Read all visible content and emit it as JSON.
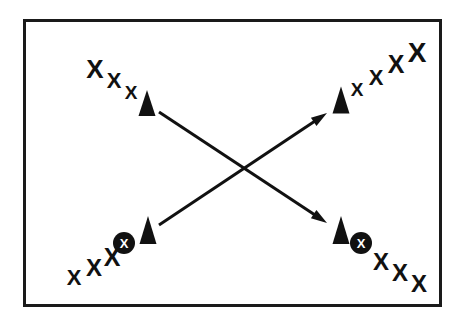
{
  "figure": {
    "background_color": "#ffffff",
    "ink_color": "#111111",
    "frame": {
      "name": "diagram-border",
      "x": 23,
      "y": 19,
      "width": 419,
      "height": 288,
      "stroke_width": 3,
      "color": "#1a1a1a"
    },
    "x_mark_glyph": "X",
    "circled_x_glyph": "X",
    "clusters": [
      {
        "id": "top-left",
        "label": "top-left-cluster",
        "x_marks": [
          {
            "cx": 95,
            "cy": 69,
            "size": 26
          },
          {
            "cx": 114,
            "cy": 80,
            "size": 22
          },
          {
            "cx": 131,
            "cy": 92,
            "size": 19
          }
        ],
        "cones": [
          {
            "cx": 147,
            "cy": 103,
            "width": 17,
            "height": 26
          }
        ],
        "circled_x": []
      },
      {
        "id": "top-right",
        "label": "top-right-cluster",
        "x_marks": [
          {
            "cx": 357,
            "cy": 89,
            "size": 19
          },
          {
            "cx": 376,
            "cy": 77,
            "size": 22
          },
          {
            "cx": 396,
            "cy": 64,
            "size": 25
          },
          {
            "cx": 417,
            "cy": 52,
            "size": 28
          }
        ],
        "cones": [
          {
            "cx": 341,
            "cy": 100,
            "width": 17,
            "height": 27
          }
        ],
        "circled_x": []
      },
      {
        "id": "bottom-left",
        "label": "bottom-left-cluster",
        "x_marks": [
          {
            "cx": 74,
            "cy": 277,
            "size": 22
          },
          {
            "cx": 94,
            "cy": 267,
            "size": 24
          },
          {
            "cx": 112,
            "cy": 257,
            "size": 25
          }
        ],
        "cones": [
          {
            "cx": 148,
            "cy": 230,
            "width": 17,
            "height": 28
          }
        ],
        "circled_x": [
          {
            "cx": 124,
            "cy": 243,
            "r": 11
          }
        ]
      },
      {
        "id": "bottom-right",
        "label": "bottom-right-cluster",
        "x_marks": [
          {
            "cx": 381,
            "cy": 261,
            "size": 24
          },
          {
            "cx": 400,
            "cy": 272,
            "size": 24
          },
          {
            "cx": 419,
            "cy": 283,
            "size": 24
          }
        ],
        "cones": [
          {
            "cx": 341,
            "cy": 230,
            "width": 17,
            "height": 28
          }
        ],
        "circled_x": [
          {
            "cx": 361,
            "cy": 243,
            "r": 11
          }
        ]
      }
    ],
    "arrows": [
      {
        "id": "arrow-down-right",
        "label": "arrow-top-left-to-bottom-right",
        "x1": 159,
        "y1": 112,
        "x2": 327,
        "y2": 223,
        "stroke_width": 3,
        "head_length": 16,
        "head_width": 10
      },
      {
        "id": "arrow-up-right",
        "label": "arrow-bottom-left-to-top-right",
        "x1": 159,
        "y1": 225,
        "x2": 327,
        "y2": 113,
        "stroke_width": 3,
        "head_length": 16,
        "head_width": 10
      }
    ]
  }
}
